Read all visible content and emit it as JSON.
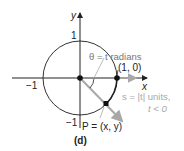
{
  "diagram": {
    "caption": "(d)",
    "axes": {
      "x_label": "x",
      "y_label": "y",
      "tick_pos_y": "1",
      "tick_neg_y": "−1",
      "tick_neg_x": "−1"
    },
    "annotations": {
      "angle": "θ = t radians",
      "point_10": "(1, 0)",
      "point_P": "P = (x, y)",
      "arc_length_line1": "s = |t| units,",
      "arc_length_line2": "t < 0"
    },
    "colors": {
      "axis": "#222222",
      "circle": "#333333",
      "ray": "#a8a8a8",
      "points": "#111111"
    }
  }
}
